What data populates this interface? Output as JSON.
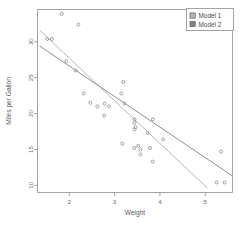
{
  "chart_data": {
    "type": "scatter",
    "title": "",
    "xlabel": "Weight",
    "ylabel": "Miles per Gallon",
    "xlim": [
      1.3,
      5.6
    ],
    "ylim": [
      9.0,
      34.5
    ],
    "xticks": [
      "2",
      "3",
      "4",
      "5"
    ],
    "xtickvalues": [
      2,
      3,
      4,
      5
    ],
    "yticks": [
      "10",
      "15",
      "20",
      "25",
      "30"
    ],
    "ytickvalues": [
      10,
      15,
      20,
      25,
      30
    ],
    "grid": false,
    "marker": "open-circle",
    "legend_position": "top-right",
    "points": [
      {
        "x": 2.62,
        "y": 21.0
      },
      {
        "x": 2.875,
        "y": 21.0
      },
      {
        "x": 2.32,
        "y": 22.8
      },
      {
        "x": 3.215,
        "y": 21.4
      },
      {
        "x": 3.44,
        "y": 18.7
      },
      {
        "x": 3.46,
        "y": 18.1
      },
      {
        "x": 3.57,
        "y": 14.3
      },
      {
        "x": 3.19,
        "y": 24.4
      },
      {
        "x": 3.15,
        "y": 22.8
      },
      {
        "x": 3.44,
        "y": 19.2
      },
      {
        "x": 3.44,
        "y": 17.8
      },
      {
        "x": 4.07,
        "y": 16.4
      },
      {
        "x": 3.73,
        "y": 17.3
      },
      {
        "x": 3.78,
        "y": 15.2
      },
      {
        "x": 5.25,
        "y": 10.4
      },
      {
        "x": 5.424,
        "y": 10.4
      },
      {
        "x": 5.345,
        "y": 14.7
      },
      {
        "x": 2.2,
        "y": 32.4
      },
      {
        "x": 1.615,
        "y": 30.4
      },
      {
        "x": 1.835,
        "y": 33.9
      },
      {
        "x": 2.465,
        "y": 21.5
      },
      {
        "x": 3.52,
        "y": 15.5
      },
      {
        "x": 3.435,
        "y": 15.2
      },
      {
        "x": 3.84,
        "y": 13.3
      },
      {
        "x": 3.845,
        "y": 19.2
      },
      {
        "x": 1.935,
        "y": 27.3
      },
      {
        "x": 2.14,
        "y": 26.0
      },
      {
        "x": 1.513,
        "y": 30.4
      },
      {
        "x": 3.17,
        "y": 15.8
      },
      {
        "x": 2.77,
        "y": 19.7
      },
      {
        "x": 3.57,
        "y": 15.0
      },
      {
        "x": 2.78,
        "y": 21.4
      }
    ],
    "series": [
      {
        "name": "Model 1",
        "type": "line",
        "color": "#b9b9b9",
        "x_endpoints": [
          1.35,
          5.05
        ],
        "y_endpoints": [
          31.6,
          9.6
        ]
      },
      {
        "name": "Model 2",
        "type": "line",
        "color": "#8f8f8f",
        "x_endpoints": [
          1.35,
          5.6
        ],
        "y_endpoints": [
          29.4,
          11.3
        ]
      }
    ],
    "legend": [
      {
        "label": "Model 1",
        "color": "#b5b5b5"
      },
      {
        "label": "Model 2",
        "color": "#848484"
      }
    ]
  }
}
